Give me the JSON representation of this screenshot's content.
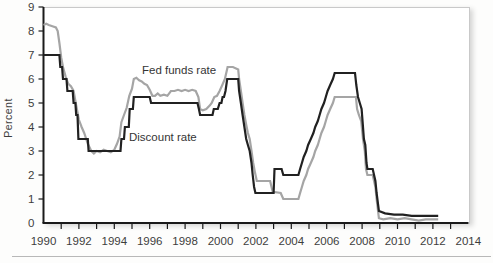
{
  "figure": {
    "ylabel": "Percent",
    "series_labels": {
      "fed_funds": "Fed funds rate",
      "discount": "Discount rate"
    }
  },
  "colors": {
    "fed_funds_line": "#a5a5a5",
    "discount_line": "#212121",
    "axis": "#1a1a1a",
    "frame_border": "#c9c9c9",
    "text": "#3d3d3d"
  },
  "chart_data": {
    "type": "line",
    "title": "",
    "xlabel": "",
    "ylabel": "Percent",
    "xlim": [
      1990,
      2014
    ],
    "ylim": [
      0,
      9
    ],
    "grid": false,
    "legend_position": "inline-annotations",
    "x_tick_label_values": [
      1990,
      1992,
      1994,
      1996,
      1998,
      2000,
      2002,
      2004,
      2006,
      2008,
      2010,
      2012,
      2014
    ],
    "x_minor_tick_years_start": 1991,
    "x_minor_tick_years_end": 2013,
    "y_tick_label_values": [
      0,
      1,
      2,
      3,
      4,
      5,
      6,
      7,
      8,
      9
    ],
    "annotations": [
      {
        "text": "Fed funds rate",
        "px": [
          142,
          74
        ],
        "anchor": "start"
      },
      {
        "text": "Discount rate",
        "px": [
          129,
          141
        ],
        "anchor": "start"
      }
    ],
    "series": [
      {
        "name": "Fed funds rate",
        "color": "#a5a5a5",
        "points": [
          [
            1990.0,
            8.25
          ],
          [
            1990.15,
            8.3
          ],
          [
            1990.3,
            8.25
          ],
          [
            1990.5,
            8.2
          ],
          [
            1990.7,
            8.15
          ],
          [
            1990.8,
            8.0
          ],
          [
            1990.9,
            7.5
          ],
          [
            1991.0,
            6.9
          ],
          [
            1991.1,
            6.5
          ],
          [
            1991.25,
            6.1
          ],
          [
            1991.4,
            5.8
          ],
          [
            1991.55,
            5.7
          ],
          [
            1991.7,
            5.5
          ],
          [
            1991.85,
            4.9
          ],
          [
            1992.0,
            4.3
          ],
          [
            1992.15,
            4.0
          ],
          [
            1992.3,
            3.75
          ],
          [
            1992.5,
            3.3
          ],
          [
            1992.7,
            3.0
          ],
          [
            1992.85,
            2.9
          ],
          [
            1993.0,
            3.0
          ],
          [
            1993.2,
            2.95
          ],
          [
            1993.4,
            3.05
          ],
          [
            1993.6,
            3.0
          ],
          [
            1993.8,
            2.95
          ],
          [
            1994.0,
            3.05
          ],
          [
            1994.15,
            3.3
          ],
          [
            1994.3,
            3.6
          ],
          [
            1994.4,
            4.2
          ],
          [
            1994.55,
            4.5
          ],
          [
            1994.7,
            4.8
          ],
          [
            1994.85,
            5.3
          ],
          [
            1995.0,
            5.6
          ],
          [
            1995.1,
            6.0
          ],
          [
            1995.25,
            6.05
          ],
          [
            1995.4,
            5.95
          ],
          [
            1995.55,
            5.9
          ],
          [
            1995.7,
            5.8
          ],
          [
            1995.85,
            5.75
          ],
          [
            1996.0,
            5.55
          ],
          [
            1996.15,
            5.3
          ],
          [
            1996.3,
            5.3
          ],
          [
            1996.45,
            5.4
          ],
          [
            1996.6,
            5.3
          ],
          [
            1996.8,
            5.35
          ],
          [
            1997.0,
            5.3
          ],
          [
            1997.2,
            5.5
          ],
          [
            1997.4,
            5.5
          ],
          [
            1997.6,
            5.55
          ],
          [
            1997.8,
            5.5
          ],
          [
            1998.0,
            5.55
          ],
          [
            1998.2,
            5.5
          ],
          [
            1998.4,
            5.55
          ],
          [
            1998.6,
            5.5
          ],
          [
            1998.75,
            5.25
          ],
          [
            1998.85,
            4.75
          ],
          [
            1999.0,
            4.7
          ],
          [
            1999.2,
            4.75
          ],
          [
            1999.4,
            4.9
          ],
          [
            1999.5,
            5.0
          ],
          [
            1999.65,
            5.25
          ],
          [
            1999.8,
            5.3
          ],
          [
            1999.95,
            5.5
          ],
          [
            2000.1,
            5.75
          ],
          [
            2000.25,
            6.0
          ],
          [
            2000.4,
            6.5
          ],
          [
            2000.7,
            6.5
          ],
          [
            2001.0,
            6.4
          ],
          [
            2001.05,
            6.0
          ],
          [
            2001.15,
            5.5
          ],
          [
            2001.25,
            5.0
          ],
          [
            2001.35,
            4.5
          ],
          [
            2001.45,
            4.1
          ],
          [
            2001.55,
            3.75
          ],
          [
            2001.65,
            3.5
          ],
          [
            2001.75,
            3.0
          ],
          [
            2001.85,
            2.5
          ],
          [
            2001.95,
            2.1
          ],
          [
            2002.05,
            1.75
          ],
          [
            2002.8,
            1.75
          ],
          [
            2002.95,
            1.3
          ],
          [
            2003.4,
            1.25
          ],
          [
            2003.55,
            1.0
          ],
          [
            2004.4,
            1.0
          ],
          [
            2004.5,
            1.25
          ],
          [
            2004.6,
            1.5
          ],
          [
            2004.7,
            1.75
          ],
          [
            2004.85,
            2.0
          ],
          [
            2004.95,
            2.25
          ],
          [
            2005.1,
            2.5
          ],
          [
            2005.25,
            2.75
          ],
          [
            2005.35,
            3.0
          ],
          [
            2005.5,
            3.25
          ],
          [
            2005.6,
            3.5
          ],
          [
            2005.7,
            3.75
          ],
          [
            2005.85,
            4.0
          ],
          [
            2005.95,
            4.25
          ],
          [
            2006.05,
            4.5
          ],
          [
            2006.2,
            4.75
          ],
          [
            2006.35,
            5.0
          ],
          [
            2006.45,
            5.25
          ],
          [
            2007.0,
            5.25
          ],
          [
            2007.65,
            5.25
          ],
          [
            2007.72,
            4.75
          ],
          [
            2007.82,
            4.5
          ],
          [
            2007.95,
            4.25
          ],
          [
            2008.05,
            3.5
          ],
          [
            2008.15,
            3.0
          ],
          [
            2008.22,
            2.25
          ],
          [
            2008.3,
            2.0
          ],
          [
            2008.6,
            2.0
          ],
          [
            2008.75,
            1.5
          ],
          [
            2008.82,
            1.0
          ],
          [
            2008.95,
            0.2
          ],
          [
            2009.2,
            0.15
          ],
          [
            2009.6,
            0.2
          ],
          [
            2010.0,
            0.15
          ],
          [
            2010.4,
            0.2
          ],
          [
            2010.8,
            0.15
          ],
          [
            2011.2,
            0.1
          ],
          [
            2011.6,
            0.15
          ],
          [
            2012.0,
            0.15
          ],
          [
            2012.3,
            0.15
          ]
        ]
      },
      {
        "name": "Discount rate",
        "color": "#212121",
        "points": [
          [
            1990.0,
            7.0
          ],
          [
            1990.9,
            7.0
          ],
          [
            1990.95,
            6.5
          ],
          [
            1991.05,
            6.5
          ],
          [
            1991.1,
            6.0
          ],
          [
            1991.3,
            6.0
          ],
          [
            1991.35,
            5.5
          ],
          [
            1991.65,
            5.5
          ],
          [
            1991.7,
            5.0
          ],
          [
            1991.8,
            5.0
          ],
          [
            1991.85,
            4.5
          ],
          [
            1991.92,
            4.5
          ],
          [
            1991.97,
            3.5
          ],
          [
            1992.5,
            3.5
          ],
          [
            1992.55,
            3.0
          ],
          [
            1994.35,
            3.0
          ],
          [
            1994.4,
            3.5
          ],
          [
            1994.55,
            3.5
          ],
          [
            1994.6,
            4.0
          ],
          [
            1994.82,
            4.0
          ],
          [
            1994.87,
            4.75
          ],
          [
            1995.05,
            4.75
          ],
          [
            1995.1,
            5.25
          ],
          [
            1996.0,
            5.25
          ],
          [
            1996.08,
            5.0
          ],
          [
            1998.7,
            5.0
          ],
          [
            1998.78,
            4.75
          ],
          [
            1998.85,
            4.5
          ],
          [
            1999.55,
            4.5
          ],
          [
            1999.62,
            4.75
          ],
          [
            1999.85,
            4.75
          ],
          [
            1999.95,
            5.0
          ],
          [
            2000.05,
            5.0
          ],
          [
            2000.12,
            5.25
          ],
          [
            2000.2,
            5.25
          ],
          [
            2000.28,
            5.5
          ],
          [
            2000.38,
            6.0
          ],
          [
            2001.0,
            6.0
          ],
          [
            2001.05,
            5.5
          ],
          [
            2001.15,
            5.0
          ],
          [
            2001.25,
            4.5
          ],
          [
            2001.35,
            4.0
          ],
          [
            2001.45,
            3.5
          ],
          [
            2001.55,
            3.25
          ],
          [
            2001.65,
            3.0
          ],
          [
            2001.75,
            2.5
          ],
          [
            2001.82,
            2.0
          ],
          [
            2001.9,
            1.5
          ],
          [
            2001.97,
            1.25
          ],
          [
            2003.0,
            1.25
          ],
          [
            2003.05,
            2.25
          ],
          [
            2003.45,
            2.25
          ],
          [
            2003.55,
            2.0
          ],
          [
            2004.4,
            2.0
          ],
          [
            2004.5,
            2.25
          ],
          [
            2004.6,
            2.5
          ],
          [
            2004.7,
            2.75
          ],
          [
            2004.85,
            3.0
          ],
          [
            2004.95,
            3.25
          ],
          [
            2005.1,
            3.5
          ],
          [
            2005.25,
            3.75
          ],
          [
            2005.35,
            4.0
          ],
          [
            2005.5,
            4.25
          ],
          [
            2005.6,
            4.5
          ],
          [
            2005.7,
            4.75
          ],
          [
            2005.85,
            5.0
          ],
          [
            2005.95,
            5.25
          ],
          [
            2006.05,
            5.5
          ],
          [
            2006.2,
            5.75
          ],
          [
            2006.35,
            6.0
          ],
          [
            2006.45,
            6.25
          ],
          [
            2007.6,
            6.25
          ],
          [
            2007.67,
            5.75
          ],
          [
            2007.77,
            5.25
          ],
          [
            2007.87,
            5.0
          ],
          [
            2007.97,
            4.75
          ],
          [
            2008.05,
            4.0
          ],
          [
            2008.1,
            3.5
          ],
          [
            2008.18,
            3.25
          ],
          [
            2008.25,
            2.5
          ],
          [
            2008.3,
            2.25
          ],
          [
            2008.6,
            2.25
          ],
          [
            2008.75,
            1.75
          ],
          [
            2008.82,
            1.25
          ],
          [
            2008.95,
            0.5
          ],
          [
            2009.3,
            0.4
          ],
          [
            2009.8,
            0.35
          ],
          [
            2010.3,
            0.35
          ],
          [
            2010.8,
            0.3
          ],
          [
            2011.5,
            0.3
          ],
          [
            2012.3,
            0.3
          ]
        ]
      }
    ]
  }
}
